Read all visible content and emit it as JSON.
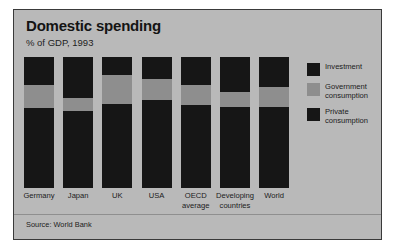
{
  "figure": {
    "title": "Domestic spending",
    "subtitle": "% of GDP, 1993",
    "source": "Source: World Bank",
    "panel_color": "#b9b9b9",
    "border_color": "#3a3a3a"
  },
  "legend": {
    "position": "right",
    "items": [
      {
        "label": "Investment",
        "color": "#161616"
      },
      {
        "label": "Government consumption",
        "color": "#8e8e8e"
      },
      {
        "label": "Private consumption",
        "color": "#161616"
      }
    ]
  },
  "chart_data": {
    "type": "bar",
    "stacked": true,
    "title": "Domestic spending",
    "subtitle": "% of GDP, 1993",
    "xlabel": "",
    "ylabel": "% of GDP",
    "ylim": [
      0,
      100
    ],
    "grid": false,
    "legend_position": "right",
    "annotations": [
      "Source: World Bank"
    ],
    "categories": [
      "Germany",
      "Japan",
      "UK",
      "USA",
      "OECD average",
      "Developing countries",
      "World"
    ],
    "series": [
      {
        "name": "Private consumption",
        "color": "#161616",
        "values": [
          61,
          59,
          64,
          67,
          63,
          62,
          62
        ]
      },
      {
        "name": "Government consumption",
        "color": "#8e8e8e",
        "values": [
          18,
          10,
          22,
          16,
          16,
          11,
          15
        ]
      },
      {
        "name": "Investment",
        "color": "#161616",
        "values": [
          21,
          31,
          14,
          17,
          21,
          27,
          23
        ]
      }
    ]
  }
}
